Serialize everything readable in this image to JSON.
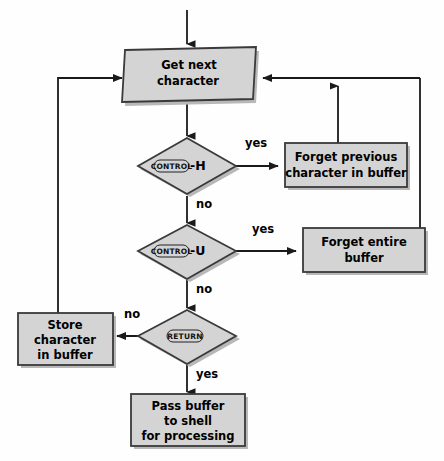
{
  "diagram": {
    "background_color": "#fefefe",
    "shape_fill": "#d4d4d4",
    "shape_stroke": "#3a3a3a",
    "shadow_color": "#b8b8b8",
    "line_color": "#1a1a1a",
    "text_color": "#000000"
  },
  "nodes": {
    "get_next_character": {
      "shape": "parallelogram",
      "line1": "Get next",
      "line2": "character"
    },
    "control_h": {
      "shape": "diamond",
      "key": "CONTROL",
      "suffix": "-H"
    },
    "forget_previous": {
      "shape": "rectangle",
      "line1": "Forget previous",
      "line2": "character in buffer"
    },
    "control_u": {
      "shape": "diamond",
      "key": "CONTROL",
      "suffix": "-U"
    },
    "forget_entire": {
      "shape": "rectangle",
      "line1": "Forget entire",
      "line2": "buffer"
    },
    "return_key": {
      "shape": "diamond",
      "key": "RETURN",
      "suffix": ""
    },
    "store_character": {
      "shape": "rectangle",
      "line1": "Store",
      "line2": "character",
      "line3": "in buffer"
    },
    "pass_buffer": {
      "shape": "rectangle",
      "line1": "Pass buffer",
      "line2": "to shell",
      "line3": "for processing"
    }
  },
  "edge_labels": {
    "h_yes": "yes",
    "h_no": "no",
    "u_yes": "yes",
    "u_no": "no",
    "return_no": "no",
    "return_yes": "yes"
  }
}
